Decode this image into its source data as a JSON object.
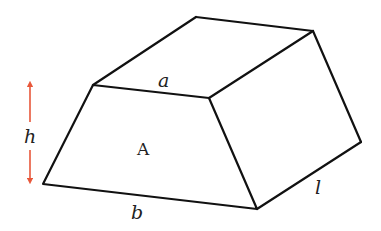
{
  "diagram": {
    "type": "truncated trapezoidal prism",
    "colors": {
      "edge": "#111111",
      "arrow": "#e8573a",
      "text": "#222222"
    },
    "labels": {
      "top_edge": "a",
      "bottom_edge": "b",
      "height": "h",
      "length": "l",
      "face_area": "A"
    },
    "vertices": {
      "front_top_left": [
        93,
        85
      ],
      "front_top_right": [
        209,
        98
      ],
      "front_bottom_right": [
        257,
        209
      ],
      "front_bottom_left": [
        43,
        184
      ],
      "back_top_left": [
        196,
        17
      ],
      "back_top_right": [
        313,
        31
      ],
      "back_bottom_right": [
        361,
        142
      ]
    }
  }
}
